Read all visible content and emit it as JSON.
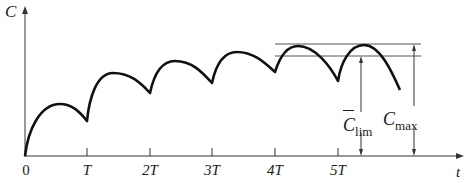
{
  "diagram": {
    "type": "concentration-time repeated-dose curve",
    "y_axis_label": "C",
    "x_axis_label": "t",
    "x_ticks": [
      "0",
      "T",
      "2T",
      "3T",
      "4T",
      "5T"
    ],
    "annotations": {
      "c_lim": {
        "base": "C",
        "overbar": true,
        "subscript": "lim"
      },
      "c_max": {
        "base": "C",
        "subscript": "max"
      }
    },
    "colors": {
      "curve": "#111111",
      "axis": "#333333",
      "reference_lines": "#555555"
    }
  }
}
